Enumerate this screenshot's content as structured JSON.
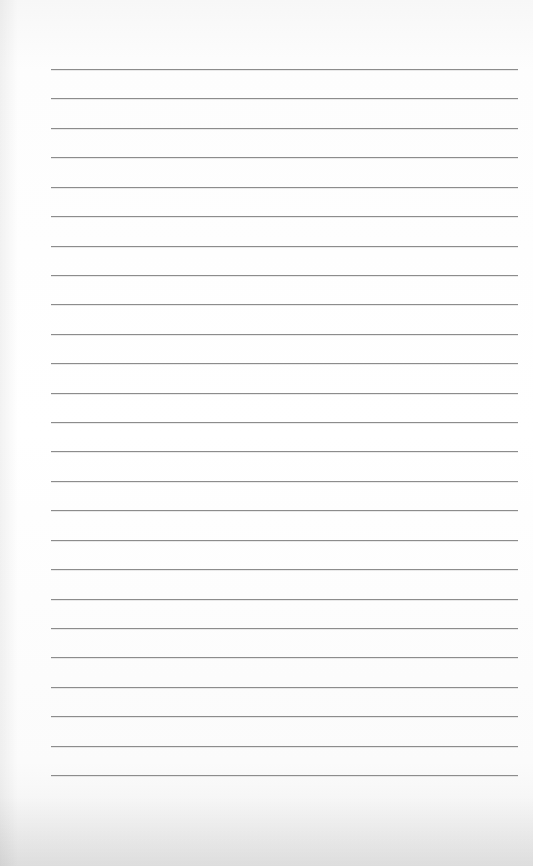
{
  "page": {
    "type": "lined-paper-sheet",
    "background_color": "#fdfdfd",
    "line_color": "#8c8c8c",
    "line_count": 25,
    "first_line_y": 69,
    "line_spacing": 29.42,
    "line_left": 51,
    "line_right": 518
  }
}
